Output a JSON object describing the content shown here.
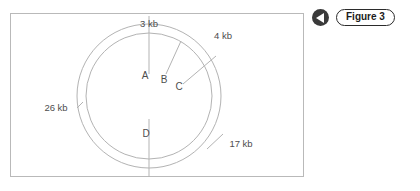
{
  "figure": {
    "frame": {
      "background_color": "#ffffff",
      "border_color": "#b9b9b9"
    },
    "diagram": {
      "kind": "circular-restriction-map",
      "line_color": "#b3b3b3",
      "text_color": "#4d4d4d",
      "outer_circle": {
        "cx": 138,
        "cy": 82,
        "r": 72
      },
      "inner_circle": {
        "cx": 138,
        "cy": 82,
        "r": 63
      },
      "site_labels": [
        {
          "id": "A",
          "text": "A"
        },
        {
          "id": "B",
          "text": "B"
        },
        {
          "id": "C",
          "text": "C"
        },
        {
          "id": "D",
          "text": "D"
        }
      ],
      "segment_labels": [
        {
          "id": "seg-3kb",
          "text": "3 kb"
        },
        {
          "id": "seg-4kb",
          "text": "4 kb"
        },
        {
          "id": "seg-26kb",
          "text": "26 kb"
        },
        {
          "id": "seg-17kb",
          "text": "17 kb"
        }
      ]
    }
  },
  "nav": {
    "prev_icon": "triangle-left-icon",
    "figure_label": "Figure 3"
  }
}
